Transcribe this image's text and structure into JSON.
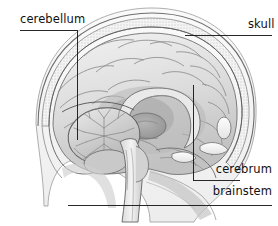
{
  "figure": {
    "orientation": "facing right",
    "background_color": "#ffffff",
    "line_color": "#111111",
    "style": "grayscale anatomical illustration"
  },
  "labels": {
    "cerebellum": "cerebellum",
    "skull": "skull",
    "cerebrum": "cerebrum",
    "brainstem": "brainstem"
  },
  "leaders": {
    "cerebellum": {
      "type": "elbow",
      "text_anchor_x": 20,
      "elbow_x": 77,
      "elbow_y": 30,
      "tip_x": 77,
      "tip_y": 140
    },
    "skull": {
      "type": "horizontal",
      "x1": 185,
      "x2": 272,
      "y": 35
    },
    "cerebrum": {
      "type": "elbow",
      "elbow_x": 193,
      "elbow_y": 180,
      "tip_x": 193,
      "tip_y": 85,
      "text_edge_x": 240
    },
    "brainstem": {
      "type": "horizontal",
      "x1": 68,
      "x2": 272,
      "y": 205
    }
  },
  "structures": [
    {
      "name": "skull",
      "description": "cranial vault with stippled diploe between inner and outer tables"
    },
    {
      "name": "scalp",
      "description": "thin outer contour line over the skull"
    },
    {
      "name": "cerebrum",
      "description": "large convoluted cerebral hemisphere showing gyri and sulci"
    },
    {
      "name": "corpus-callosum",
      "description": "C-shaped arched white matter band at the brain center"
    },
    {
      "name": "thalamus",
      "description": "oval mass below the corpus callosum"
    },
    {
      "name": "cerebellum",
      "description": "posterior inferior lobed mass with arbor vitae branching pattern"
    },
    {
      "name": "brainstem",
      "description": "stalk descending from the midbrain toward the spinal cord"
    },
    {
      "name": "nasal-cavity",
      "description": "anterior airway region below the frontal lobe"
    },
    {
      "name": "facial-profile",
      "description": "outline of the face and jaw at the right"
    }
  ]
}
